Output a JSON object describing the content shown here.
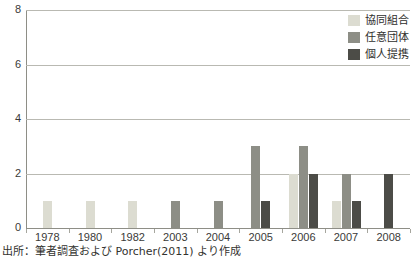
{
  "chart_data": {
    "type": "bar",
    "title": "",
    "subtitle": "",
    "xlabel": "",
    "ylabel": "",
    "categories": [
      "1978",
      "1980",
      "1982",
      "2003",
      "2004",
      "2005",
      "2006",
      "2007",
      "2008"
    ],
    "series": [
      {
        "name": "協同組合",
        "color": "#dcdcd1",
        "values": [
          1,
          1,
          1,
          0,
          0,
          0,
          2,
          1,
          0
        ]
      },
      {
        "name": "任意団体",
        "color": "#8d8e86",
        "values": [
          0,
          0,
          0,
          1,
          1,
          3,
          3,
          2,
          0
        ]
      },
      {
        "name": "個人提携",
        "color": "#4c4c47",
        "values": [
          0,
          0,
          0,
          0,
          0,
          1,
          2,
          1,
          2
        ]
      }
    ],
    "ylim": [
      0,
      8
    ],
    "yticks": [
      0,
      2,
      4,
      6,
      8
    ],
    "ytick_labels": [
      "0",
      "2",
      "4",
      "6",
      "8"
    ],
    "grid": true,
    "legend_position": "top-right",
    "annotations": [
      "出所：筆者調査および Porcher(2011) より作成"
    ]
  },
  "legend": {
    "items": [
      {
        "label": "協同組合",
        "swatch": "coop-swatch"
      },
      {
        "label": "任意団体",
        "swatch": "voluntary-swatch"
      },
      {
        "label": "個人提携",
        "swatch": "individual-swatch"
      }
    ]
  },
  "source": {
    "text": "出所：筆者調査および Porcher(2011) より作成"
  },
  "colors": {
    "coop": "#dcdcd1",
    "voluntary": "#8d8e86",
    "individual": "#4c4c47",
    "gridline": "#b9b9b2",
    "axis": "#8e8e86",
    "text": "#3a3a38",
    "background": "#ffffff"
  }
}
